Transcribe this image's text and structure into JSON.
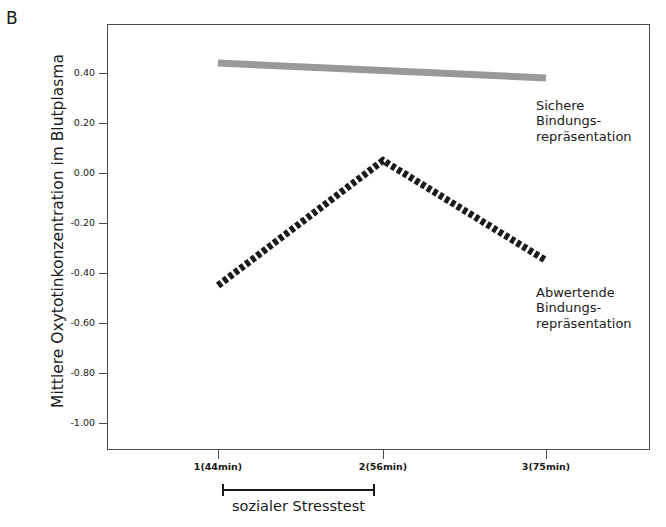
{
  "panel": {
    "letter": "B"
  },
  "axes": {
    "ylabel": "Mittlere Oxytotinkonzentration im Blutplasma",
    "xlabel": "",
    "ytick_labels": [
      "0.40",
      "0.20",
      "0.00",
      "-0.20",
      "-0.40",
      "-0.60",
      "-0.80",
      "-1.00"
    ],
    "xtick_labels": [
      "1(44min)",
      "2(56min)",
      "3(75min)"
    ]
  },
  "annotations": {
    "secure": "Sichere\nBindungs-\nrepräsentation",
    "devaluing": "Abwertende\nBindungs-\nrepräsentation",
    "bracket_label": "sozialer Stresstest"
  },
  "colors": {
    "secure_line": "#999999",
    "devaluing_line": "#1a1a1a",
    "axis": "#4a4a52",
    "background": "#ffffff"
  },
  "chart_data": {
    "type": "line",
    "title": "",
    "xlabel": "",
    "ylabel": "Mittlere Oxytotinkonzentration im Blutplasma",
    "categories": [
      "1(44min)",
      "2(56min)",
      "3(75min)"
    ],
    "x": [
      1,
      2,
      3
    ],
    "ylim": [
      -1.1,
      0.55
    ],
    "yticks": [
      0.4,
      0.2,
      0.0,
      -0.2,
      -0.4,
      -0.6,
      -0.8,
      -1.0
    ],
    "grid": false,
    "legend": "inline-annotation",
    "series": [
      {
        "name": "Sichere Bindungsrepräsentation",
        "values": [
          0.44,
          0.41,
          0.38
        ],
        "color": "#999999",
        "style": "thick-solid-grey"
      },
      {
        "name": "Abwertende Bindungsrepräsentation",
        "values": [
          -0.45,
          0.05,
          -0.35
        ],
        "color": "#1a1a1a",
        "style": "thick-dotted-black"
      }
    ],
    "annotations": [
      {
        "text": "sozialer Stresstest",
        "from": "1(44min)",
        "to": "2(56min)",
        "kind": "bracket"
      }
    ]
  }
}
